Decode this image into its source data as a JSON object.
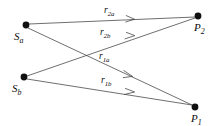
{
  "figure": {
    "type": "ray-diagram",
    "background_color": "#ffffff",
    "line_color": "#4a4a4a",
    "node_color": "#101010",
    "width": 217,
    "height": 126
  },
  "nodes": [
    {
      "id": "Sa",
      "base": "S",
      "subscript": "a",
      "label": "S_a",
      "x": 26,
      "y": 25,
      "r": 3.4,
      "label_x": 14,
      "label_y": 31
    },
    {
      "id": "Sb",
      "base": "S",
      "subscript": "b",
      "label": "S_b",
      "x": 24,
      "y": 77,
      "r": 3.4,
      "label_x": 12,
      "label_y": 83
    },
    {
      "id": "P2",
      "base": "P",
      "subscript": "2",
      "label": "P_2",
      "x": 198,
      "y": 16,
      "r": 3.4,
      "label_x": 194,
      "label_y": 22
    },
    {
      "id": "P1",
      "base": "P",
      "subscript": "1",
      "label": "P_1",
      "x": 195,
      "y": 107,
      "r": 3.4,
      "label_x": 191,
      "label_y": 113
    }
  ],
  "rays": [
    {
      "id": "r2a",
      "base": "r",
      "subscript": "2a",
      "label": "r_2a",
      "from": "Sa",
      "to": "P2",
      "x1": 29,
      "y1": 24,
      "x2": 195,
      "y2": 17,
      "arrow_x": 133,
      "arrow_y": 19,
      "label_x": 104,
      "label_y": 6
    },
    {
      "id": "r2b",
      "base": "r",
      "subscript": "2b",
      "label": "r_2b",
      "from": "Sb",
      "to": "P2",
      "x1": 27,
      "y1": 76,
      "x2": 195,
      "y2": 18,
      "arrow_x": 133,
      "arrow_y": 36,
      "label_x": 100,
      "label_y": 28
    },
    {
      "id": "r1a",
      "base": "r",
      "subscript": "1a",
      "label": "r_1a",
      "from": "Sa",
      "to": "P1",
      "x1": 28,
      "y1": 28,
      "x2": 192,
      "y2": 105,
      "arrow_x": 131,
      "arrow_y": 76,
      "label_x": 99,
      "label_y": 52
    },
    {
      "id": "r1b",
      "base": "r",
      "subscript": "1b",
      "label": "r_1b",
      "from": "Sb",
      "to": "P1",
      "x1": 27,
      "y1": 79,
      "x2": 192,
      "y2": 105,
      "arrow_x": 133,
      "arrow_y": 92,
      "label_x": 101,
      "label_y": 76
    }
  ]
}
